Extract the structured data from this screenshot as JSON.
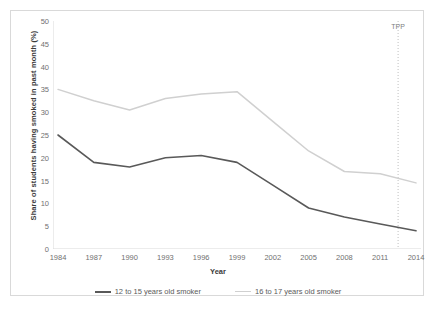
{
  "chart_data": {
    "type": "line",
    "title": "",
    "xlabel": "Year",
    "ylabel": "Share of students having smoked in past month (%)",
    "x": [
      1984,
      1987,
      1990,
      1993,
      1996,
      1999,
      2002,
      2005,
      2008,
      2011,
      2014
    ],
    "categories": [
      "1984",
      "1987",
      "1990",
      "1993",
      "1996",
      "1999",
      "2002",
      "2005",
      "2008",
      "2011",
      "2014"
    ],
    "xlim": [
      1984,
      2014
    ],
    "ylim": [
      0,
      50
    ],
    "yticks": [
      0,
      5,
      10,
      15,
      20,
      25,
      30,
      35,
      40,
      45,
      50
    ],
    "ytick_labels": [
      "0",
      "5",
      "10",
      "15",
      "20",
      "25",
      "30",
      "35",
      "40",
      "45",
      "50"
    ],
    "grid": false,
    "legend_position": "bottom",
    "series": [
      {
        "name": "12 to 15 years old smoker",
        "color": "#595959",
        "values": [
          25.0,
          19.0,
          18.0,
          20.0,
          20.5,
          19.0,
          14.0,
          9.0,
          7.0,
          5.5,
          4.0
        ]
      },
      {
        "name": "16 to 17 years old smoker",
        "color": "#d0d0d0",
        "values": [
          35.0,
          32.5,
          30.5,
          33.0,
          34.0,
          34.5,
          28.0,
          21.5,
          17.0,
          16.5,
          14.5
        ]
      }
    ],
    "annotations": [
      {
        "label": "TPP",
        "type": "vertical-line",
        "x": 2012.5,
        "style": "dotted",
        "color": "#bfbfbf"
      }
    ]
  },
  "legend": {
    "items": [
      {
        "label": "12 to 15 years old smoker",
        "color": "#595959"
      },
      {
        "label": "16 to 17 years old smoker",
        "color": "#d0d0d0"
      }
    ]
  },
  "axes": {
    "y_title": "Share of students having smoked in past month (%)",
    "x_title": "Year"
  }
}
